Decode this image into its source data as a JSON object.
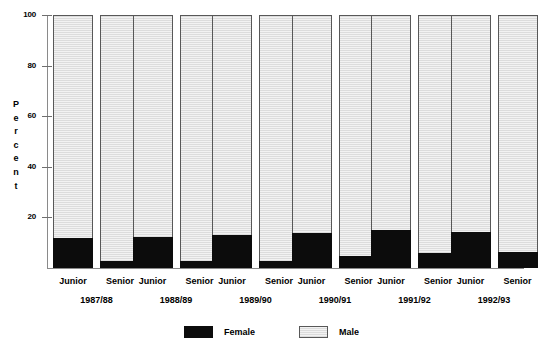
{
  "chart_data": {
    "type": "bar",
    "subtype": "stacked-100-percent",
    "title": "",
    "xlabel": "",
    "ylabel": "Percent",
    "ylim": [
      0,
      100
    ],
    "yticks": [
      20,
      40,
      60,
      80,
      100
    ],
    "ytick_labels": [
      "20",
      "40",
      "60",
      "80",
      "100"
    ],
    "grid": false,
    "legend_position": "bottom-center",
    "legend": [
      "Female",
      "Male"
    ],
    "colors": {
      "female": "#0c0c0c",
      "male": "#e2e2e2",
      "axis": "#8a8a8a",
      "bar_border": "#585858",
      "text": "#000000"
    },
    "categories": [
      "1987/88",
      "1988/89",
      "1989/90",
      "1990/91",
      "1991/92",
      "1992/93"
    ],
    "subcategories": [
      "Junior",
      "Senior"
    ],
    "groups": [
      {
        "year": "1987/88",
        "bars": [
          {
            "rank": "Junior",
            "female": 11.7,
            "male": 88.3
          },
          {
            "rank": "Senior",
            "female": 2.6,
            "male": 97.4
          }
        ]
      },
      {
        "year": "1988/89",
        "bars": [
          {
            "rank": "Junior",
            "female": 12.3,
            "male": 87.7
          },
          {
            "rank": "Senior",
            "female": 2.8,
            "male": 97.2
          }
        ]
      },
      {
        "year": "1989/90",
        "bars": [
          {
            "rank": "Junior",
            "female": 13.0,
            "male": 87.0
          },
          {
            "rank": "Senior",
            "female": 2.8,
            "male": 97.2
          }
        ]
      },
      {
        "year": "1990/91",
        "bars": [
          {
            "rank": "Junior",
            "female": 13.8,
            "male": 86.2
          },
          {
            "rank": "Senior",
            "female": 4.7,
            "male": 95.3
          }
        ]
      },
      {
        "year": "1991/92",
        "bars": [
          {
            "rank": "Junior",
            "female": 15.0,
            "male": 85.0
          },
          {
            "rank": "Senior",
            "female": 5.9,
            "male": 94.1
          }
        ]
      },
      {
        "year": "1992/93",
        "bars": [
          {
            "rank": "Junior",
            "female": 14.2,
            "male": 85.8
          },
          {
            "rank": "Senior",
            "female": 6.3,
            "male": 93.7
          }
        ]
      }
    ]
  },
  "axis": {
    "y_title_letters": [
      "P",
      "e",
      "r",
      "c",
      "e",
      "n",
      "t"
    ]
  }
}
